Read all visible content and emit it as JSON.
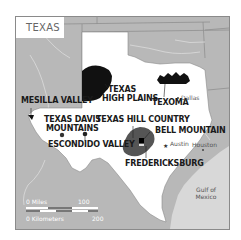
{
  "map": {
    "title": "TEXAS",
    "colors": {
      "land_neighbor": "#b8b8b8",
      "texas": "#ffffff",
      "water": "#d8d8d8",
      "region_dark": "#111111",
      "hill_country": "#555555",
      "frame": "#8a8a8a"
    },
    "regions": [
      {
        "name": "MESILLA VALLEY"
      },
      {
        "name": "TEXAS HIGH PLAINS",
        "line1": "TEXAS",
        "line2": "HIGH PLAINS"
      },
      {
        "name": "TEXOMA"
      },
      {
        "name": "TEXAS DAVIS MOUNTAINS",
        "line1": "TEXAS DAVIS",
        "line2": "MOUNTAINS"
      },
      {
        "name": "TEXAS HILL COUNTRY"
      },
      {
        "name": "ESCONDIDO VALLEY"
      },
      {
        "name": "BELL MOUNTAIN"
      },
      {
        "name": "FREDERICKSBURG"
      }
    ],
    "cities": [
      {
        "name": "Dallas",
        "icon": "dot-icon"
      },
      {
        "name": "Austin",
        "icon": "star-icon",
        "capital": true
      },
      {
        "name": "Houston",
        "icon": "dot-icon"
      }
    ],
    "water_label": {
      "line1": "Gulf of",
      "line2": "Mexico"
    },
    "scale": {
      "miles_label": "0 Miles",
      "miles_value": "100",
      "km_label": "0 Kilometers",
      "km_value": "200"
    }
  }
}
